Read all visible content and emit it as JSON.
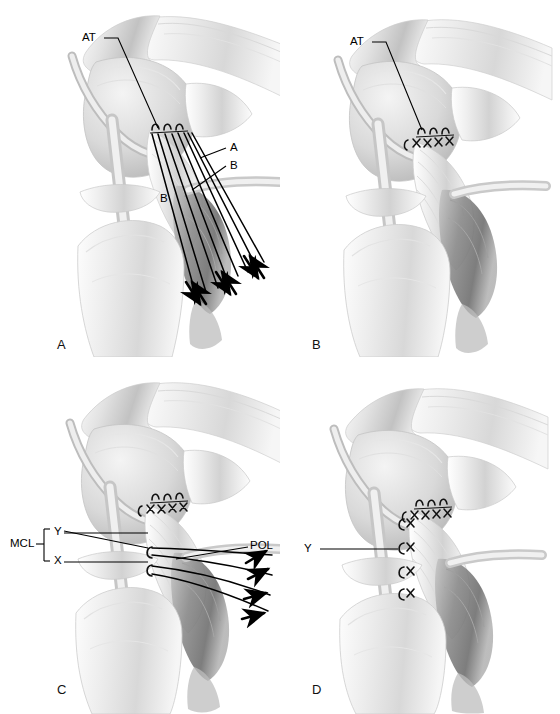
{
  "figure": {
    "type": "medical-illustration",
    "background_color": "#ffffff",
    "ink_color": "#000000",
    "tissue_light": "#f2f2f2",
    "tissue_mid": "#d4d4d4",
    "tissue_dark": "#9a9a9a",
    "tissue_shadow": "#6e6e6e",
    "panel_count": 4
  },
  "panels": [
    {
      "id": "A",
      "letter": "A",
      "labels": [
        {
          "name": "adductor-tubercle",
          "text": "AT"
        },
        {
          "name": "suture-limb-a",
          "text": "A"
        },
        {
          "name": "suture-limb-b-right",
          "text": "B"
        },
        {
          "name": "suture-limb-b-left",
          "text": "B"
        }
      ],
      "suture_anchor_count": 3,
      "traction_arrow_count": 6,
      "suture_line_count": 8
    },
    {
      "id": "B",
      "letter": "B",
      "labels": [
        {
          "name": "adductor-tubercle",
          "text": "AT"
        }
      ],
      "suture_anchor_count": 3,
      "knot_count": 4,
      "traction_arrow_count": 0
    },
    {
      "id": "C",
      "letter": "C",
      "labels": [
        {
          "name": "posterior-oblique-ligament",
          "text": "POL"
        },
        {
          "name": "medial-collateral-ligament",
          "text": "MCL"
        },
        {
          "name": "mcl-layer-y",
          "text": "Y"
        },
        {
          "name": "mcl-layer-x",
          "text": "X"
        }
      ],
      "suture_anchor_count": 2,
      "traction_arrow_count": 4,
      "suture_line_count": 4
    },
    {
      "id": "D",
      "letter": "D",
      "labels": [
        {
          "name": "mcl-layer-y",
          "text": "Y"
        }
      ],
      "knot_count": 4,
      "traction_arrow_count": 0
    }
  ]
}
